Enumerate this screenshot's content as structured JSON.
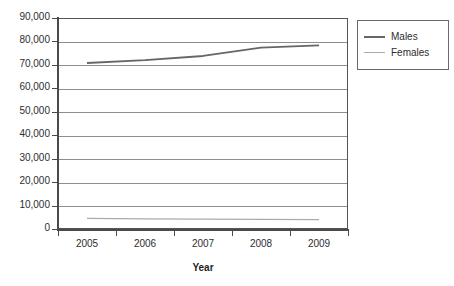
{
  "chart_data": {
    "type": "line",
    "title": "",
    "xlabel": "Year",
    "ylabel": "",
    "categories": [
      "2005",
      "2006",
      "2007",
      "2008",
      "2009"
    ],
    "series": [
      {
        "name": "Males",
        "values": [
          70800,
          72000,
          73800,
          77400,
          78300
        ],
        "color": "#666666"
      },
      {
        "name": "Females",
        "values": [
          4500,
          4350,
          4200,
          4100,
          4000
        ],
        "color": "#aaaaaa"
      }
    ],
    "ylim": [
      0,
      90000
    ],
    "yticks": [
      "0",
      "10,000",
      "20,000",
      "30,000",
      "40,000",
      "50,000",
      "60,000",
      "70,000",
      "80,000",
      "90,000"
    ],
    "ytick_values": [
      0,
      10000,
      20000,
      30000,
      40000,
      50000,
      60000,
      70000,
      80000,
      90000
    ],
    "grid": true,
    "legend_position": "top-right"
  },
  "legend": {
    "entries": [
      {
        "label": "Males"
      },
      {
        "label": "Females"
      }
    ]
  },
  "axes": {
    "x_title": "Year"
  }
}
